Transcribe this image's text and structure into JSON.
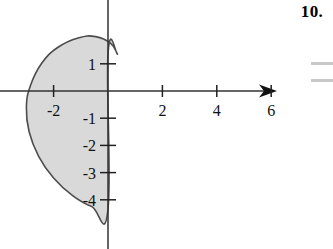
{
  "figure": {
    "problem_number": "10.",
    "region_fill_color": "#d9d9d9",
    "region_stroke_color": "#4d4d4d",
    "axis_color": "#333333"
  },
  "chart_data": {
    "type": "line",
    "title": "",
    "subtitle": "",
    "xlabel": "",
    "ylabel": "",
    "grid": false,
    "legend": null,
    "xlim": [
      -3.6,
      7.3
    ],
    "ylim": [
      -5.3,
      2.6
    ],
    "x_ticks": [
      2,
      4,
      6
    ],
    "x_tick_labels": [
      "2",
      "4",
      "6"
    ],
    "y_ticks": [
      1,
      -1,
      -2,
      -3,
      -4
    ],
    "y_tick_labels": [
      "1",
      "-1",
      "-2",
      "-3",
      "-4"
    ],
    "extra_tick_labels": [
      {
        "axis": "x",
        "value": -2,
        "label": "-2"
      }
    ],
    "x_axis_arrow": true,
    "annotations": [],
    "series": [
      {
        "name": "shaded region boundary",
        "closed": true,
        "filled": true,
        "note": "cardioid-like closed curve occupying quadrants II and III, bulging slightly right of the y-axis near y=1, leftmost extent near x=-3, lowest point on the y-axis near y=-4.3",
        "points": [
          [
            0.35,
            1.35
          ],
          [
            0.1,
            1.75
          ],
          [
            -0.45,
            2.0
          ],
          [
            -1.1,
            1.95
          ],
          [
            -1.85,
            1.6
          ],
          [
            -2.45,
            1.0
          ],
          [
            -2.85,
            0.2
          ],
          [
            -3.0,
            -0.6
          ],
          [
            -2.9,
            -1.5
          ],
          [
            -2.55,
            -2.4
          ],
          [
            -2.0,
            -3.2
          ],
          [
            -1.3,
            -3.85
          ],
          [
            -0.6,
            -4.25
          ],
          [
            0.0,
            -4.35
          ],
          [
            0.0,
            1.35
          ],
          [
            0.35,
            1.35
          ]
        ]
      }
    ]
  },
  "edge_marks": {
    "count": 2,
    "description": "faint cropped page rules at right edge"
  }
}
